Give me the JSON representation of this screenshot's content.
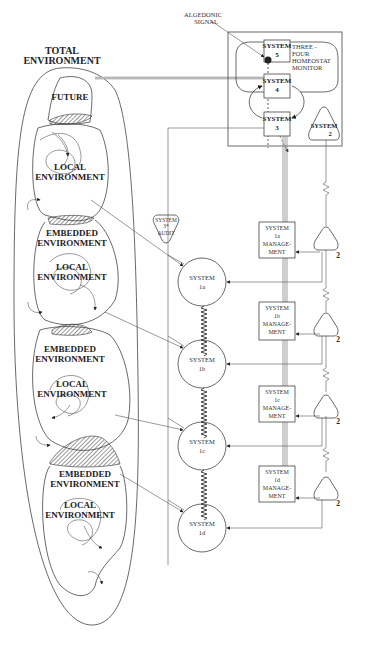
{
  "diagram": {
    "total_environment": {
      "line1": "TOTAL",
      "line2": "ENVIRONMENT"
    },
    "future_label": "FUTURE",
    "environments": [
      {
        "outer_line1": "",
        "outer_line2": "",
        "local_line1": "LOCAL",
        "local_line2": "ENVIRONMENT"
      },
      {
        "outer_line1": "EMBEDDED",
        "outer_line2": "ENVIRONMENT",
        "local_line1": "LOCAL",
        "local_line2": "ENVIRONMENT"
      },
      {
        "outer_line1": "EMBEDDED",
        "outer_line2": "ENVIRONMENT",
        "local_line1": "LOCAL",
        "local_line2": "ENVIRONMENT"
      },
      {
        "outer_line1": "EMBEDDED",
        "outer_line2": "ENVIRONMENT",
        "local_line1": "LOCAL",
        "local_line2": "ENVIRONMENT"
      }
    ],
    "algedonic": {
      "line1": "ALGEDONIC",
      "line2": "SIGNAL"
    },
    "homeostat": {
      "line1": "THREE -",
      "line2": "FOUR",
      "line3": "HOMEOSTAT",
      "line4": "MONITOR"
    },
    "system5": {
      "line1": "SYSTEM",
      "line2": "5"
    },
    "system4": {
      "line1": "SYSTEM",
      "line2": "4"
    },
    "system3": {
      "line1": "SYSTEM",
      "line2": "3"
    },
    "system2": {
      "line1": "SYSTEM",
      "line2": "2"
    },
    "audit": {
      "line1": "SYSTEM",
      "line2": "3*",
      "line3": "AUDIT"
    },
    "operations": [
      {
        "circle_line1": "SYSTEM",
        "circle_line2": "1a",
        "mgmt_line1": "SYSTEM",
        "mgmt_line2": "1a",
        "mgmt_line3": "MANAGE-",
        "mgmt_line4": "MENT",
        "triangle_label": "2"
      },
      {
        "circle_line1": "SYSTEM",
        "circle_line2": "1b",
        "mgmt_line1": "SYSTEM",
        "mgmt_line2": "1b",
        "mgmt_line3": "MANAGE-",
        "mgmt_line4": "MENT",
        "triangle_label": "2"
      },
      {
        "circle_line1": "SYSTEM",
        "circle_line2": "1c",
        "mgmt_line1": "SYSTEM",
        "mgmt_line2": "1c",
        "mgmt_line3": "MANAGE-",
        "mgmt_line4": "MENT",
        "triangle_label": "2"
      },
      {
        "circle_line1": "SYSTEM",
        "circle_line2": "1d",
        "mgmt_line1": "SYSTEM",
        "mgmt_line2": "1d",
        "mgmt_line3": "MANAGE-",
        "mgmt_line4": "MENT",
        "triangle_label": "2"
      }
    ]
  }
}
